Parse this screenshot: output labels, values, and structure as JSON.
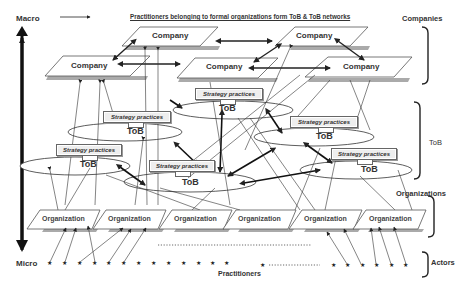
{
  "axis": {
    "top_label": "Macro",
    "bottom_label": "Micro"
  },
  "header": {
    "title": "Practitioners belonging to formal organizations form ToB & ToB networks"
  },
  "levels": {
    "companies": "Companies",
    "tob": "ToB",
    "organizations": "Organizations",
    "actors": "Actors"
  },
  "companies": [
    {
      "label": "Company"
    },
    {
      "label": "Company"
    },
    {
      "label": "Company"
    },
    {
      "label": "Company"
    },
    {
      "label": "Company"
    }
  ],
  "tob_nodes": [
    {
      "label": "ToB",
      "practice": "Strategy practices"
    },
    {
      "label": "ToB",
      "practice": "Strategy practices"
    },
    {
      "label": "ToB",
      "practice": "Strategy practices"
    },
    {
      "label": "ToB",
      "practice": "Strategy practices"
    },
    {
      "label": "ToB",
      "practice": "Strategy practices"
    },
    {
      "label": "ToB",
      "practice": "Strategy practices"
    }
  ],
  "organizations": [
    {
      "label": "Organization"
    },
    {
      "label": "Organization"
    },
    {
      "label": "Organization"
    },
    {
      "label": "Organization"
    },
    {
      "label": "Organization"
    },
    {
      "label": "Organization"
    }
  ],
  "actors": {
    "label": "Practitioners",
    "star_glyph": "★"
  }
}
